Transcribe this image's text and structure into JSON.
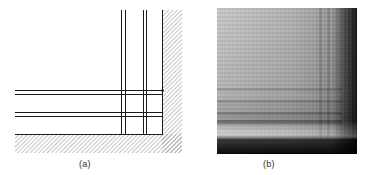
{
  "figure": {
    "panels": [
      {
        "id": "a",
        "label": "(a)",
        "kind": "line-drawing",
        "description": "Schematic of grid lines meeting a hatched corner wall"
      },
      {
        "id": "b",
        "label": "(b)",
        "kind": "photograph",
        "description": "Grayscale photograph of a textured grid pattern in a corner, dark shadow along right and bottom edges"
      }
    ],
    "colors": {
      "line": "#1a1a1a",
      "hatch": "#8a8a8a",
      "photo_light": "#c8c8c8",
      "photo_dark": "#151515"
    }
  }
}
